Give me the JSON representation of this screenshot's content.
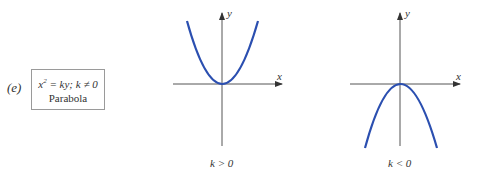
{
  "panel_label": "(e)",
  "equation_box": {
    "equation_lhs": "x",
    "equation_exp": "2",
    "equation_rhs": " = ky; k ≠ 0",
    "name": "Parabola"
  },
  "graphs": [
    {
      "id": "k-positive",
      "caption": "k > 0",
      "x_label": "x",
      "y_label": "y",
      "opens": "up"
    },
    {
      "id": "k-negative",
      "caption": "k < 0",
      "x_label": "x",
      "y_label": "y",
      "opens": "down"
    }
  ],
  "colors": {
    "curve": "#2b4fb0",
    "axis": "#333333"
  }
}
